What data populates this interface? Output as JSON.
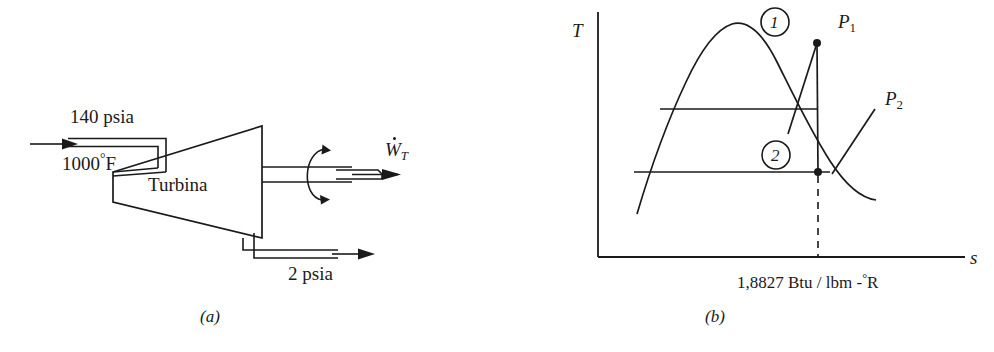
{
  "figure": {
    "panel_a": {
      "caption": "(a)",
      "inlet_pressure": "140 psia",
      "inlet_temperature_value": "1000",
      "inlet_temperature_unit": "F",
      "device_label": "Turbina",
      "outlet_pressure": "2 psia",
      "work_symbol": "W",
      "work_subscript": "T"
    },
    "panel_b": {
      "caption": "(b)",
      "y_axis_label": "T",
      "x_axis_label": "s",
      "state_points": [
        {
          "id": "1",
          "label": "1",
          "x": 817,
          "y": 43
        },
        {
          "id": "2",
          "label": "2",
          "x": 818,
          "y": 172
        }
      ],
      "isobar_labels": [
        {
          "symbol": "P",
          "subscript": "1"
        },
        {
          "symbol": "P",
          "subscript": "2"
        }
      ],
      "entropy_readout": "1,8827 Btu / lbm -",
      "entropy_readout_unit": "R"
    }
  },
  "style": {
    "ink": "#1a1a1a",
    "background": "#ffffff"
  }
}
